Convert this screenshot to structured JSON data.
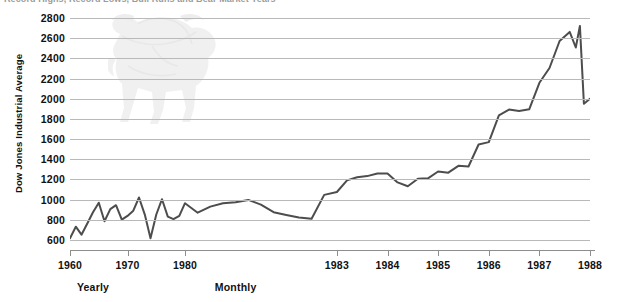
{
  "chart_data": {
    "type": "line",
    "title": "Record Highs, Record Lows, Bull Runs and Bear Market Years",
    "subtitle": "",
    "xlabel": "",
    "ylabel": "Dow Jones Industrial Average",
    "ylim": [
      500,
      2800
    ],
    "yticks": [
      600,
      800,
      1000,
      1200,
      1400,
      1600,
      1800,
      2000,
      2200,
      2400,
      2600,
      2800
    ],
    "ytick_labels": [
      "600",
      "800",
      "1000",
      "1200",
      "1400",
      "1600",
      "1800",
      "2000",
      "2200",
      "2400",
      "2600",
      "2800"
    ],
    "xticks": [
      1960,
      1970,
      1980,
      1983,
      1984,
      1985,
      1986,
      1987,
      1988
    ],
    "xtick_labels": [
      "1960",
      "1970",
      "1980",
      "1983",
      "1984",
      "1985",
      "1986",
      "1987",
      "1988"
    ],
    "grid": true,
    "legend": null,
    "series_color": "#4d4d4d",
    "section_labels": [
      {
        "label": "Yearly",
        "at_x": 1964
      },
      {
        "label": "Monthly",
        "at_x": 1981
      }
    ],
    "axis_note": "X axis is piecewise: 1960-1980 compressed yearly scale, 1980-1988 expanded monthly scale",
    "series": [
      {
        "name": "Dow Jones Industrial Average",
        "x": [
          1960,
          1961,
          1962,
          1963,
          1964,
          1965,
          1966,
          1967,
          1968,
          1969,
          1970,
          1971,
          1972,
          1973,
          1974,
          1975,
          1976,
          1977,
          1978,
          1979,
          1980,
          1980.25,
          1980.5,
          1980.75,
          1981,
          1981.25,
          1981.5,
          1981.75,
          1982,
          1982.25,
          1982.5,
          1982.75,
          1983,
          1983.2,
          1983.4,
          1983.6,
          1983.8,
          1984,
          1984.2,
          1984.4,
          1984.6,
          1984.8,
          1985,
          1985.2,
          1985.4,
          1985.6,
          1985.8,
          1986,
          1986.2,
          1986.4,
          1986.6,
          1986.8,
          1987,
          1987.2,
          1987.4,
          1987.6,
          1987.72,
          1987.8,
          1987.88,
          1988
        ],
        "y": [
          616,
          731,
          652,
          763,
          874,
          969,
          786,
          905,
          944,
          800,
          838,
          890,
          1020,
          851,
          616,
          852,
          1004,
          831,
          805,
          838,
          964,
          870,
          930,
          963,
          974,
          997,
          950,
          875,
          848,
          822,
          810,
          1046,
          1075,
          1190,
          1221,
          1233,
          1258,
          1259,
          1170,
          1132,
          1206,
          1211,
          1278,
          1266,
          1335,
          1328,
          1546,
          1570,
          1835,
          1892,
          1878,
          1895,
          2158,
          2304,
          2572,
          2662,
          2508,
          2722,
          1950,
          2000
        ]
      }
    ]
  },
  "axes": {
    "y_label": "Dow Jones Industrial Average"
  },
  "title": {
    "text": "Record Highs, Record Lows, Bull Runs and Bear Market Years"
  },
  "watermark": {
    "name": "bull-silhouette"
  }
}
